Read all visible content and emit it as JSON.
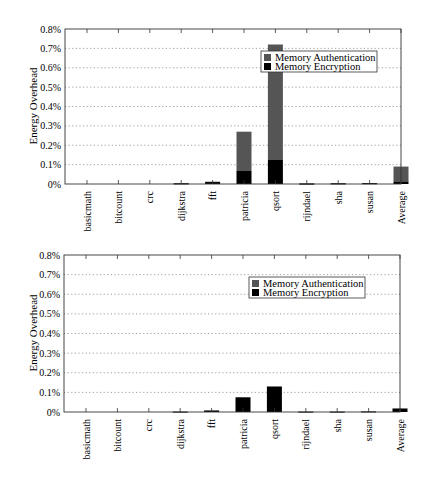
{
  "colors": {
    "authentication": "#555555",
    "encryption": "#000000",
    "grid": "#888888",
    "axis": "#333333"
  },
  "chart_data": [
    {
      "type": "bar",
      "stacked": true,
      "title": "",
      "xlabel": "",
      "ylabel": "Energy Overhead",
      "ylim": [
        0,
        0.8
      ],
      "yticks": [
        "0%",
        "0.1%",
        "0.2%",
        "0.3%",
        "0.4%",
        "0.5%",
        "0.6%",
        "0.7%",
        "0.8%"
      ],
      "grid": "horizontal dotted",
      "legend_position": "upper right (inside, near qsort)",
      "categories": [
        "basicmath",
        "bitcount",
        "crc",
        "dijkstra",
        "fft",
        "patricia",
        "qsort",
        "rijndael",
        "sha",
        "susan",
        "Average"
      ],
      "series": [
        {
          "name": "Memory Encryption",
          "values": [
            0.0,
            0.0,
            0.0,
            0.003,
            0.01,
            0.067,
            0.124,
            0.002,
            0.003,
            0.004,
            0.013
          ]
        },
        {
          "name": "Memory Authentication",
          "values": [
            0.0,
            0.0,
            0.0,
            0.001,
            0.002,
            0.203,
            0.596,
            0.001,
            0.001,
            0.001,
            0.077
          ]
        }
      ],
      "totals": [
        0.0,
        0.0,
        0.0,
        0.004,
        0.012,
        0.27,
        0.72,
        0.003,
        0.004,
        0.005,
        0.09
      ]
    },
    {
      "type": "bar",
      "stacked": true,
      "title": "",
      "xlabel": "",
      "ylabel": "Energy Overhead",
      "ylim": [
        0,
        0.8
      ],
      "yticks": [
        "0%",
        "0.1%",
        "0.2%",
        "0.3%",
        "0.4%",
        "0.5%",
        "0.6%",
        "0.7%",
        "0.8%"
      ],
      "grid": "horizontal dotted",
      "legend_position": "upper right (inside)",
      "categories": [
        "basicmath",
        "bitcount",
        "crc",
        "dijkstra",
        "fft",
        "patricia",
        "qsort",
        "rijndael",
        "sha",
        "susan",
        "Average"
      ],
      "series": [
        {
          "name": "Memory Encryption",
          "values": [
            0.0,
            0.0,
            0.0,
            0.002,
            0.008,
            0.075,
            0.13,
            0.002,
            0.002,
            0.003,
            0.018
          ]
        },
        {
          "name": "Memory Authentication",
          "values": [
            0.0,
            0.0,
            0.0,
            0.0,
            0.0,
            0.0,
            0.0,
            0.0,
            0.0,
            0.0,
            0.0
          ]
        }
      ],
      "totals": [
        0.0,
        0.0,
        0.0,
        0.002,
        0.008,
        0.075,
        0.13,
        0.002,
        0.002,
        0.003,
        0.018
      ]
    }
  ],
  "charts": [
    {
      "ylabel": "Energy Overhead",
      "legend": [
        "Memory Authentication",
        "Memory Encryption"
      ]
    },
    {
      "ylabel": "Energy Overhead",
      "legend": [
        "Memory Authentication",
        "Memory Encryption"
      ]
    }
  ]
}
